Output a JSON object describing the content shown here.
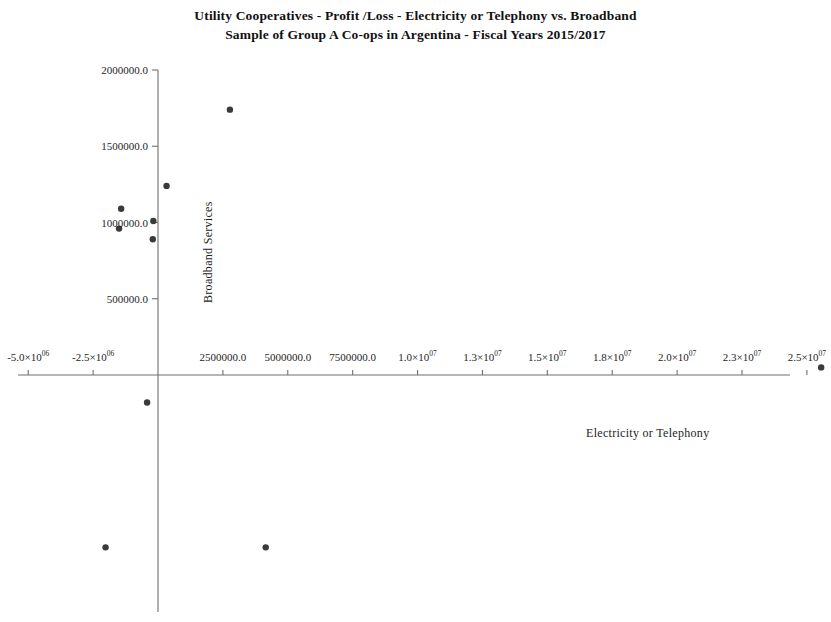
{
  "chart_data": {
    "type": "scatter",
    "title": "Utility Cooperatives - Profit /Loss - Electricity or Telephony vs. Broadband",
    "subtitle": "Sample of Group A Co-ops in Argentina - Fiscal Years 2015/2017",
    "xlabel": "Electricity or Telephony",
    "ylabel": "Broadband Services",
    "xlim": [
      -6200000,
      26500000
    ],
    "ylim": [
      -9200000,
      2150000
    ],
    "grid": false,
    "legend": "none",
    "marker": {
      "shape": "circle",
      "color": "#3a3a3a",
      "size": 4
    },
    "axis_color": "#6e6e6e",
    "xticks": [
      {
        "value": -5000000,
        "label": "-5.0×10",
        "exponent": "06"
      },
      {
        "value": -2500000,
        "label": "-2.5×10",
        "exponent": "06"
      },
      {
        "value": 2500000,
        "label": "2500000.0",
        "exponent": ""
      },
      {
        "value": 5000000,
        "label": "5000000.0",
        "exponent": ""
      },
      {
        "value": 7500000,
        "label": "7500000.0",
        "exponent": ""
      },
      {
        "value": 10000000,
        "label": "1.0×10",
        "exponent": "07"
      },
      {
        "value": 12500000,
        "label": "1.3×10",
        "exponent": "07"
      },
      {
        "value": 15000000,
        "label": "1.5×10",
        "exponent": "07"
      },
      {
        "value": 17500000,
        "label": "1.8×10",
        "exponent": "07"
      },
      {
        "value": 20000000,
        "label": "2.0×10",
        "exponent": "07"
      },
      {
        "value": 22500000,
        "label": "2.3×10",
        "exponent": "07"
      },
      {
        "value": 25000000,
        "label": "2.5×10",
        "exponent": "07"
      }
    ],
    "yticks": [
      {
        "value": 500000,
        "label": "500000.0"
      },
      {
        "value": 1000000,
        "label": "1000000.0"
      },
      {
        "value": 1500000,
        "label": "1500000.0"
      },
      {
        "value": 2000000,
        "label": "2000000.0"
      }
    ],
    "points": [
      {
        "x": 2770000,
        "y": 1740000
      },
      {
        "x": 330000,
        "y": 1240000
      },
      {
        "x": -1420000,
        "y": 1090000
      },
      {
        "x": -1500000,
        "y": 960000
      },
      {
        "x": -180000,
        "y": 1010000
      },
      {
        "x": -200000,
        "y": 890000
      },
      {
        "x": 25550000,
        "y": 50000
      },
      {
        "x": -420000,
        "y": -180000
      },
      {
        "x": -2020000,
        "y": -1130000
      },
      {
        "x": 4150000,
        "y": -1130000
      },
      {
        "x": 0,
        "y": -2230000
      },
      {
        "x": 0,
        "y": -2650000
      },
      {
        "x": -1050000,
        "y": -4990000
      },
      {
        "x": -1800000,
        "y": -5880000
      },
      {
        "x": 7380000,
        "y": -7880000
      },
      {
        "x": 11580000,
        "y": -7050000
      },
      {
        "x": 23700000,
        "y": -6990000
      }
    ]
  }
}
